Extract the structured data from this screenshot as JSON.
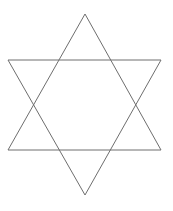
{
  "canvas": {
    "width": 173,
    "height": 211,
    "background": "#ffffff"
  },
  "figure": {
    "shape": "hexagram",
    "stroke_color": "#6e6e6e",
    "stroke_width": 1,
    "triangles": [
      {
        "name": "upward-triangle",
        "points": [
          [
            85,
            14
          ],
          [
            161,
            150
          ],
          [
            8,
            150
          ]
        ]
      },
      {
        "name": "downward-triangle",
        "points": [
          [
            8,
            60
          ],
          [
            161,
            60
          ],
          [
            85,
            195
          ]
        ]
      }
    ]
  }
}
